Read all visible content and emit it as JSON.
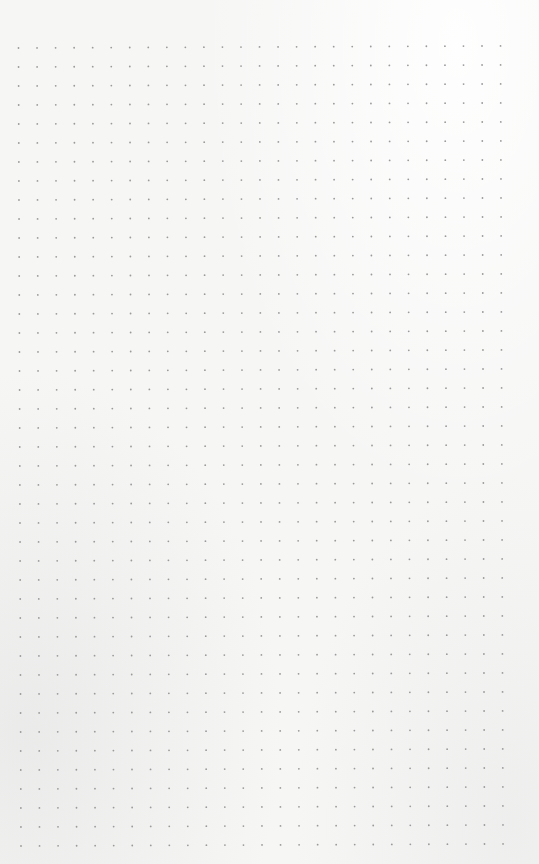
{
  "page": {
    "type": "dot-grid-paper",
    "background_color": "#f6f6f5",
    "dot_color": "#9a9a9a"
  },
  "grid": {
    "columns": 27,
    "rows": 43,
    "origin_x": 18.5,
    "origin_y": 48,
    "spacing_x": 18.54,
    "spacing_y": 19.0,
    "dot_radius": 0.9
  }
}
